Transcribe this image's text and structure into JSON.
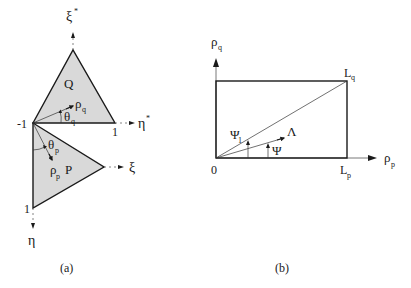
{
  "panel_a": {
    "caption": "(a)",
    "triangle_q": {
      "label": "Q",
      "rho": "ρ",
      "rho_sub": "q",
      "theta": "θ",
      "theta_sub": "q"
    },
    "triangle_p": {
      "label": "P",
      "rho": "ρ",
      "rho_sub": "p",
      "theta": "θ",
      "theta_sub": "p"
    },
    "axes": {
      "xi_star": "ξ",
      "xi_star_sup": "*",
      "eta_star": "η",
      "eta_star_sup": "*",
      "xi": "ξ",
      "eta": "η"
    },
    "ticks": {
      "minus_one": "-1",
      "one_right": "1",
      "one_bottom": "1"
    }
  },
  "panel_b": {
    "caption": "(b)",
    "y_axis": {
      "symbol": "ρ",
      "sub": "q"
    },
    "x_axis": {
      "symbol": "ρ",
      "sub": "p"
    },
    "origin": "0",
    "corner_top": {
      "symbol": "L",
      "sub": "q"
    },
    "corner_right": {
      "symbol": "L",
      "sub": "p"
    },
    "lambda": "Λ",
    "psi": "Ψ",
    "psi1": {
      "symbol": "Ψ",
      "sub": "1"
    }
  }
}
